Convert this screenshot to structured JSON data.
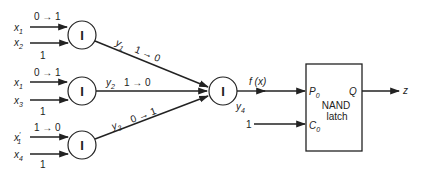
{
  "diagram": {
    "inputs": [
      {
        "id": "x1a",
        "name": "x",
        "sub": "1",
        "prime": "",
        "transition": "0 → 1"
      },
      {
        "id": "x2",
        "name": "x",
        "sub": "2",
        "prime": "",
        "value": "1"
      },
      {
        "id": "x1b",
        "name": "x",
        "sub": "1",
        "prime": "",
        "transition": "0 → 1"
      },
      {
        "id": "x3",
        "name": "x",
        "sub": "3",
        "prime": "",
        "value": "1"
      },
      {
        "id": "x1p",
        "name": "x",
        "sub": "1",
        "prime": "′",
        "transition": "1 → 0"
      },
      {
        "id": "x4",
        "name": "x",
        "sub": "4",
        "prime": "",
        "value": "1"
      }
    ],
    "gates": [
      {
        "id": "g1",
        "symbol": "I",
        "output": "y",
        "output_sub": "1",
        "transition": "1 → 0"
      },
      {
        "id": "g2",
        "symbol": "I",
        "output": "y",
        "output_sub": "2",
        "transition": "1 → 0"
      },
      {
        "id": "g3",
        "symbol": "I",
        "output": "y",
        "output_sub": "3",
        "transition": "0 → 1"
      },
      {
        "id": "g4",
        "symbol": "I",
        "output": "y",
        "output_sub": "4"
      }
    ],
    "fx_label": "f (x)",
    "constant_input": "1",
    "latch": {
      "line1": "NAND",
      "line2": "latch",
      "p_label": "P",
      "p_sub": "0",
      "c_label": "C",
      "c_sub": "0",
      "q_label": "Q"
    },
    "output_label": "z"
  }
}
